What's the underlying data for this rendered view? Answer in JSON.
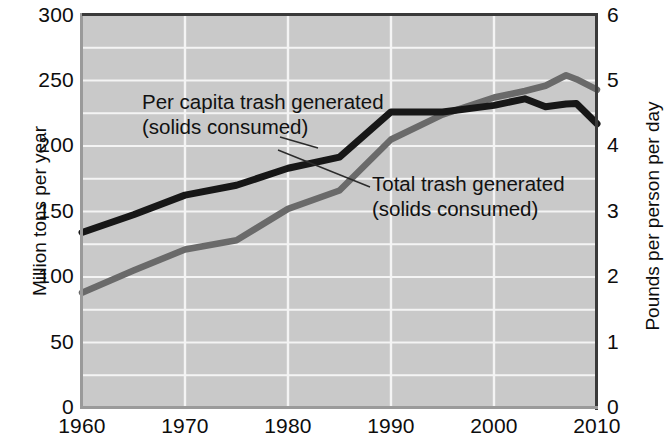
{
  "chart_data": {
    "type": "line",
    "title": "",
    "xlabel": "",
    "ylabel_left": "Million tons per year",
    "ylabel_right": "Pounds per person per day",
    "xlim": [
      1960,
      2010
    ],
    "xticks": [
      "1960",
      "1970",
      "1980",
      "1990",
      "2000",
      "2010"
    ],
    "ylim_left": [
      0,
      300
    ],
    "yticks_left": [
      "0",
      "50",
      "100",
      "150",
      "200",
      "250",
      "300"
    ],
    "ylim_right": [
      0,
      6
    ],
    "yticks_right": [
      "0",
      "1",
      "2",
      "3",
      "4",
      "5",
      "6"
    ],
    "grid": true,
    "legend_position": "in-plot annotations",
    "plot_background": "#c9c9c9",
    "gridline_color": "#f2f2f2",
    "series": [
      {
        "name": "Per capita trash generated (solids consumed)",
        "axis": "right",
        "units": "Pounds per person per day",
        "color": "#171717",
        "x": [
          1960,
          1965,
          1970,
          1975,
          1980,
          1985,
          1990,
          1995,
          2000,
          2003,
          2005,
          2007,
          2008,
          2010
        ],
        "values": [
          2.68,
          2.95,
          3.25,
          3.4,
          3.66,
          3.83,
          4.52,
          4.52,
          4.62,
          4.72,
          4.6,
          4.64,
          4.65,
          4.34
        ]
      },
      {
        "name": "Total trash generated (solids consumed)",
        "axis": "left",
        "units": "Million tons per year",
        "color": "#6a6a6a",
        "x": [
          1960,
          1965,
          1970,
          1975,
          1980,
          1985,
          1990,
          1995,
          2000,
          2003,
          2005,
          2007,
          2008,
          2010
        ],
        "values": [
          88,
          105,
          121,
          128,
          152,
          166,
          205,
          224,
          237,
          242,
          246,
          254,
          251,
          243
        ]
      }
    ],
    "annotations": [
      {
        "id": "per-capita",
        "line1": "Per capita trash generated",
        "line2": "(solids consumed)"
      },
      {
        "id": "total",
        "line1": "Total trash generated",
        "line2": "(solids consumed)"
      }
    ]
  }
}
